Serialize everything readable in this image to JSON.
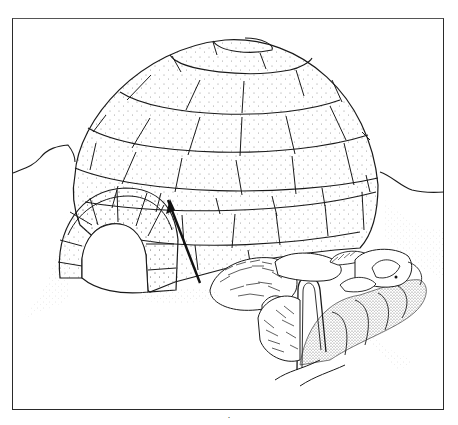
{
  "illustration": {
    "subject": "Igloo with entrance tunnel and sled dogs",
    "caption": "·",
    "colors": {
      "ink": "#1a1a1a",
      "paper": "#ffffff",
      "snow_stipple": "#9a9a9a",
      "frame": "#2a2a2a"
    },
    "elements": [
      {
        "name": "igloo-dome",
        "description": "Snow-block dome with 6 rings of blocks and a cap block at top"
      },
      {
        "name": "entrance-tunnel",
        "description": "Arched block tunnel at lower left with dark opening"
      },
      {
        "name": "snow-knife",
        "description": "Dark stick / snow knife leaning against the dome"
      },
      {
        "name": "sled-dogs",
        "description": "Group of furry sled dogs curled up on the right"
      },
      {
        "name": "sled",
        "description": "Sled with bent-wood handle and stippled load"
      },
      {
        "name": "snow-drifts",
        "description": "Background snow hills on left and right horizons"
      }
    ]
  }
}
